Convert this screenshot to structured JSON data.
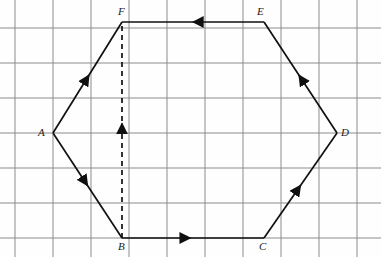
{
  "figure": {
    "kind": "geometry-diagram",
    "canvas": {
      "width": 381,
      "height": 257
    },
    "colors": {
      "grid": "#8c8c8c",
      "stroke": "#101010",
      "background": "#fefefe",
      "label": "#1a1a1a"
    }
  },
  "grid": {
    "visible": true,
    "x_lines": [
      15,
      53,
      91,
      129,
      167,
      205,
      243,
      281,
      319,
      357
    ],
    "y_lines": [
      28,
      63,
      98,
      133,
      168,
      203,
      238
    ],
    "spacing_x": 38,
    "spacing_y": 35,
    "line_width": 1
  },
  "chart_data": {
    "type": "scatter",
    "title": "",
    "xlabel": "",
    "ylabel": "",
    "points": [
      {
        "label": "A",
        "x": 53,
        "y": 133
      },
      {
        "label": "B",
        "x": 122,
        "y": 238
      },
      {
        "label": "C",
        "x": 264,
        "y": 238
      },
      {
        "label": "D",
        "x": 337,
        "y": 133
      },
      {
        "label": "E",
        "x": 264,
        "y": 22
      },
      {
        "label": "F",
        "x": 122,
        "y": 22
      }
    ],
    "edges": [
      {
        "name": "AF",
        "from": "A",
        "to": "F",
        "style": "solid",
        "arrow": "forward",
        "arrow_t": 0.52
      },
      {
        "name": "AB",
        "from": "A",
        "to": "B",
        "style": "solid",
        "arrow": "forward",
        "arrow_t": 0.5
      },
      {
        "name": "BC",
        "from": "B",
        "to": "C",
        "style": "solid",
        "arrow": "forward",
        "arrow_t": 0.48
      },
      {
        "name": "CD",
        "from": "C",
        "to": "D",
        "style": "solid",
        "arrow": "forward",
        "arrow_t": 0.5
      },
      {
        "name": "DE",
        "from": "D",
        "to": "E",
        "style": "solid",
        "arrow": "forward",
        "arrow_t": 0.52
      },
      {
        "name": "EF",
        "from": "E",
        "to": "F",
        "style": "solid",
        "arrow": "forward",
        "arrow_t": 0.5
      },
      {
        "name": "BF",
        "from": "B",
        "to": "F",
        "style": "dashed",
        "arrow": "forward",
        "arrow_t": 0.53
      }
    ]
  },
  "labels": {
    "A": {
      "text": "A",
      "x": 38,
      "y": 127
    },
    "B": {
      "text": "B",
      "x": 118,
      "y": 241
    },
    "C": {
      "text": "C",
      "x": 259,
      "y": 241
    },
    "D": {
      "text": "D",
      "x": 341,
      "y": 127
    },
    "E": {
      "text": "E",
      "x": 257,
      "y": 6
    },
    "F": {
      "text": "F",
      "x": 118,
      "y": 6
    }
  }
}
